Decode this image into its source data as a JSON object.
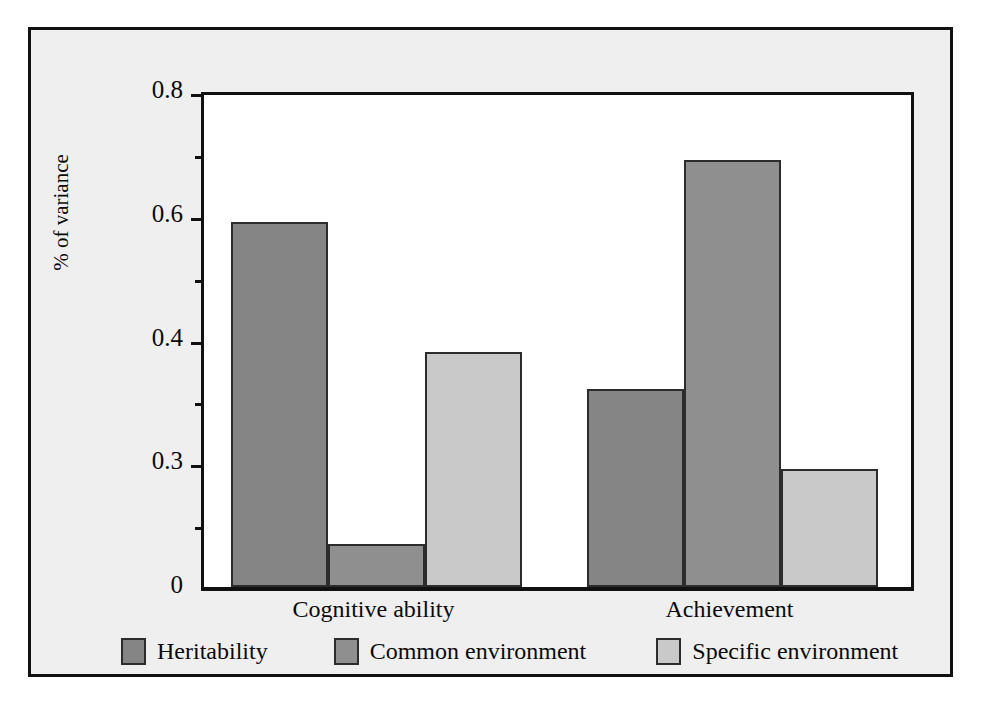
{
  "chart_data": {
    "type": "bar",
    "title": "",
    "subtitle": "",
    "xlabel": "",
    "ylabel": "% of variance",
    "categories": [
      "Cognitive ability",
      "Achievement"
    ],
    "series": [
      {
        "name": "Heritability",
        "color": "#858585",
        "values": [
          0.59,
          0.32
        ]
      },
      {
        "name": "Common environment",
        "color": "#8f8f8f",
        "values": [
          0.07,
          0.69
        ]
      },
      {
        "name": "Specific environment",
        "color": "#c9c9c9",
        "values": [
          0.38,
          0.19
        ]
      }
    ],
    "ylim": [
      0,
      0.8
    ],
    "y_tick_labels": [
      "0.8",
      "0.6",
      "0.4",
      "0.3",
      "0"
    ],
    "y_tick_values": [
      0.8,
      0.6,
      0.4,
      0.2,
      0
    ],
    "y_minor_tick_values": [
      0.7,
      0.5,
      0.3,
      0.1
    ],
    "grid": false,
    "legend_position": "bottom"
  },
  "legend": {
    "items": [
      {
        "label": "Heritability",
        "color": "#858585"
      },
      {
        "label": "Common environment",
        "color": "#8f8f8f"
      },
      {
        "label": "Specific environment",
        "color": "#c9c9c9"
      }
    ]
  },
  "axis": {
    "y_title": "% of variance"
  },
  "colors": {
    "frame": "#111111",
    "plot_background": "#ffffff",
    "figure_background": "#efefef",
    "bar_outline": "#2c2c2c"
  }
}
